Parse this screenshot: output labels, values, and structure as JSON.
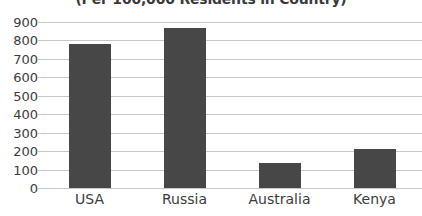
{
  "chart_data": {
    "type": "bar",
    "title": "",
    "subtitle": "(Per 100,000 Residents in Country)",
    "categories": [
      "USA",
      "Russia",
      "Australia",
      "Kenya"
    ],
    "values": [
      780,
      870,
      135,
      210
    ],
    "xlabel": "",
    "ylabel": "",
    "ylim": [
      0,
      900
    ],
    "ytick_step": 100,
    "yticks": [
      900,
      800,
      700,
      600,
      500,
      400,
      300,
      200,
      100,
      0
    ],
    "ytick_labels": [
      "900",
      "800",
      "700",
      "600",
      "500",
      "400",
      "300",
      "200",
      "100",
      "0"
    ],
    "grid": true,
    "legend": false,
    "bar_color": "#474747",
    "gridline_color": "#c6c6c6",
    "background_color": "#ffffff",
    "text_color": "#3c3c3c"
  }
}
